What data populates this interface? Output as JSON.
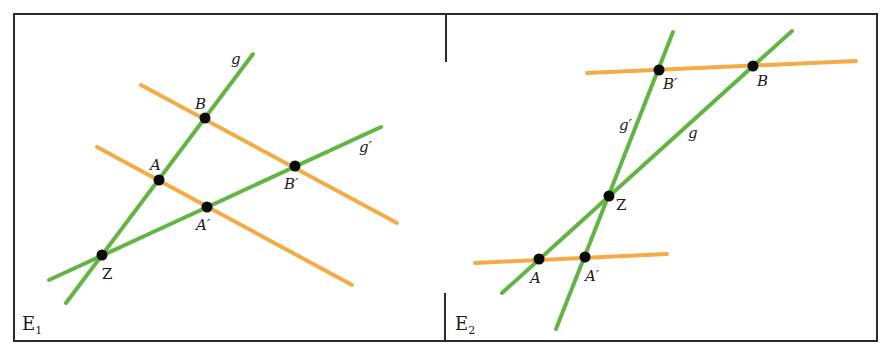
{
  "figure": {
    "colors": {
      "lines_g": "#62b544",
      "parallels": "#f3ab45",
      "points": "#0a0a0a",
      "frame": "#2a2a2a"
    },
    "panel_left": {
      "plane_label": "E",
      "plane_sub": "1",
      "line_g_label": "g",
      "line_g_prime_label": "g′",
      "points": {
        "Z": "Z",
        "A": "A",
        "B": "B",
        "A_prime": "A′",
        "B_prime": "B′"
      }
    },
    "panel_right": {
      "plane_label": "E",
      "plane_sub": "2",
      "line_g_label": "g",
      "line_g_prime_label": "g′",
      "points": {
        "Z": "Z",
        "A": "A",
        "B": "B",
        "A_prime": "A′",
        "B_prime": "B′"
      }
    }
  }
}
